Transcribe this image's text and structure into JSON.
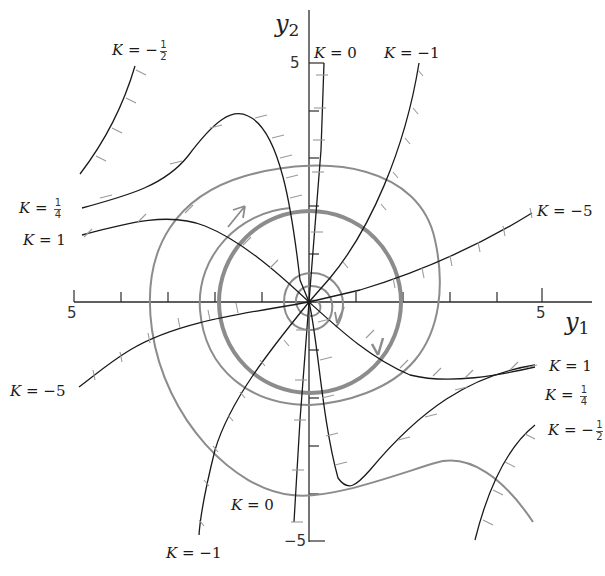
{
  "figure": {
    "type": "phase-plane isocline diagram",
    "axes": {
      "x_label": "y",
      "x_label_sub": "1",
      "y_label": "y",
      "y_label_sub": "2",
      "x_tick_labels": {
        "left": "5",
        "right": "5"
      },
      "y_tick_labels": {
        "top": "5",
        "bottom": "−5"
      },
      "x_range": [
        -5,
        5
      ],
      "y_range": [
        -5,
        5
      ]
    },
    "isocline_labels": [
      {
        "id": "k-neg-half-upper",
        "text": "K = −",
        "num": "1",
        "den": "2"
      },
      {
        "id": "k-quarter-left",
        "text": "K = ",
        "num": "1",
        "den": "4"
      },
      {
        "id": "k-one-left",
        "text": "K = 1"
      },
      {
        "id": "k-zero-top",
        "text": "K = 0"
      },
      {
        "id": "k-neg-one-top",
        "text": "K = −1"
      },
      {
        "id": "k-neg-five-right",
        "text": "K = −5"
      },
      {
        "id": "k-neg-five-left",
        "text": "K = −5"
      },
      {
        "id": "k-one-right",
        "text": "K = 1"
      },
      {
        "id": "k-quarter-right",
        "text": "K = ",
        "num": "1",
        "den": "4"
      },
      {
        "id": "k-neg-half-lower",
        "text": "K = −",
        "num": "1",
        "den": "2"
      },
      {
        "id": "k-zero-bottom",
        "text": "K = 0"
      },
      {
        "id": "k-neg-one-bottom",
        "text": "K = −1"
      }
    ],
    "colors": {
      "isocline": "#1a1a1a",
      "trajectory": "#8c8c8c",
      "limit_cycle": "#8c8c8c",
      "axis": "#2a2a2a"
    }
  }
}
